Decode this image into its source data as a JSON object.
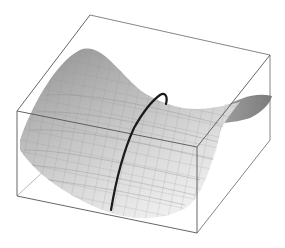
{
  "figure": {
    "type": "3d-surface-plot",
    "colors": {
      "background": "#ffffff",
      "box_edge": "#555555",
      "surface_light": "#e6e6e6",
      "surface_mid": "#c2c2c2",
      "surface_dark": "#8a8a8a",
      "mesh_line": "#9a9a9a",
      "curve": "#1a1a1a"
    },
    "box": {
      "front_top_left": [
        17,
        111
      ],
      "front_top_right": [
        197,
        147
      ],
      "front_bottom_left": [
        17,
        196
      ],
      "front_bottom_right": [
        197,
        233
      ],
      "back_top_left": [
        90,
        15
      ],
      "back_top_right": [
        270,
        55
      ],
      "back_bottom_right": [
        270,
        140
      ]
    },
    "curve": {
      "label": "path-on-surface",
      "points": [
        [
          111,
          210
        ],
        [
          118,
          175
        ],
        [
          126,
          148
        ],
        [
          134,
          128
        ],
        [
          143,
          113
        ],
        [
          152,
          102
        ],
        [
          160,
          95
        ],
        [
          165,
          94
        ],
        [
          167,
          98
        ],
        [
          166,
          104
        ]
      ]
    }
  }
}
